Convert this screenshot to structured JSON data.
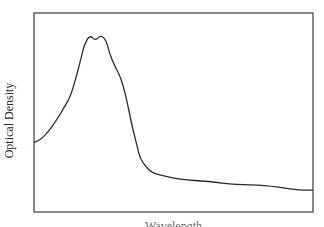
{
  "chart_data": {
    "type": "line",
    "title": "",
    "xlabel": "Wavelength",
    "ylabel": "Optical Density",
    "xlim": [
      0,
      1
    ],
    "ylim": [
      0,
      1
    ],
    "grid": false,
    "legend": null,
    "ticks": {
      "x": [],
      "y": []
    },
    "series": [
      {
        "name": "Absorption spectrum",
        "color": "#2b2b2b",
        "x": [
          0.0,
          0.02,
          0.05,
          0.08,
          0.11,
          0.13,
          0.15,
          0.17,
          0.18,
          0.2,
          0.22,
          0.24,
          0.26,
          0.27,
          0.29,
          0.31,
          0.33,
          0.35,
          0.37,
          0.38,
          0.4,
          0.42,
          0.44,
          0.47,
          0.5,
          0.55,
          0.6,
          0.65,
          0.7,
          0.75,
          0.8,
          0.85,
          0.9,
          0.95,
          1.0
        ],
        "y": [
          0.35,
          0.36,
          0.4,
          0.46,
          0.53,
          0.58,
          0.67,
          0.78,
          0.84,
          0.89,
          0.86,
          0.89,
          0.86,
          0.8,
          0.73,
          0.68,
          0.58,
          0.44,
          0.33,
          0.27,
          0.23,
          0.2,
          0.19,
          0.18,
          0.17,
          0.16,
          0.157,
          0.15,
          0.14,
          0.138,
          0.135,
          0.13,
          0.12,
          0.11,
          0.11
        ]
      }
    ]
  },
  "plot_frame": {
    "left": 34,
    "top": 13,
    "right": 313,
    "bottom": 212
  }
}
